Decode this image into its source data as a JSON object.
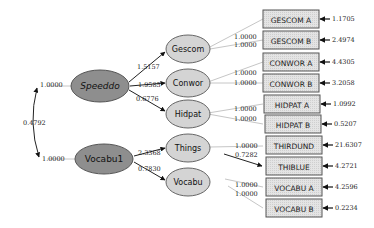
{
  "diagram": {
    "type": "structural-equation-model",
    "colors": {
      "latent_second_order": "#8a8a8a",
      "latent_first_order": "#d4d4d4",
      "observed": "#e2e2e2",
      "stroke": "#555555",
      "arrow": "#111111",
      "connector": "#c8c8c8"
    },
    "second_order_factors": [
      {
        "id": "speeddo",
        "label": "Speeddo",
        "variance": "1.0000"
      },
      {
        "id": "vocabu1",
        "label": "Vocabu1",
        "variance": "1.0000"
      }
    ],
    "factor_covariance": {
      "from": "Speeddo",
      "to": "Vocabu1",
      "value": "0.4792"
    },
    "first_order_factors": [
      {
        "id": "gescom",
        "label": "Gescom",
        "parent": "Speeddo",
        "loading": "1.5157"
      },
      {
        "id": "conwor",
        "label": "Conwor",
        "parent": "Speeddo",
        "loading": "1.9585"
      },
      {
        "id": "hidpat",
        "label": "Hidpat",
        "parent": "Speeddo",
        "loading": "0.6776"
      },
      {
        "id": "things",
        "label": "Things",
        "parent": "Vocabu1",
        "loading": "2.3368"
      },
      {
        "id": "vocabu",
        "label": "Vocabu",
        "parent": "Vocabu1",
        "loading": "0.7830"
      }
    ],
    "observed_variables": [
      {
        "label": "GESCOM A",
        "factor": "Gescom",
        "loading": "1.0000",
        "error": "1.1705"
      },
      {
        "label": "GESCOM B",
        "factor": "Gescom",
        "loading": "1.0000",
        "error": "2.4974"
      },
      {
        "label": "CONWOR A",
        "factor": "Conwor",
        "loading": "1.0000",
        "error": "4.4305"
      },
      {
        "label": "CONWOR B",
        "factor": "Conwor",
        "loading": "1.0000",
        "error": "3.2058"
      },
      {
        "label": "HIDPAT A",
        "factor": "Hidpat",
        "loading": "1.0000",
        "error": "1.0992"
      },
      {
        "label": "HIDPAT B",
        "factor": "Hidpat",
        "loading": "1.0000",
        "error": "0.5207"
      },
      {
        "label": "THIRDUND",
        "factor": "Things",
        "loading": "1.0000",
        "error": "21.6307"
      },
      {
        "label": "THIBLUE",
        "factor": "Things",
        "loading": "0.7282",
        "error": "4.2721"
      },
      {
        "label": "VOCABU A",
        "factor": "Vocabu",
        "loading": "1.0000",
        "error": "4.2596"
      },
      {
        "label": "VOCABU B",
        "factor": "Vocabu",
        "loading": "1.0000",
        "error": "0.2234"
      }
    ]
  }
}
